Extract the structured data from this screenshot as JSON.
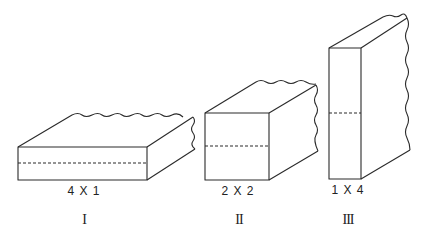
{
  "figure": {
    "shapes": [
      {
        "id": "I",
        "dimension_label": "4 X 1",
        "numeral": "I",
        "description": "wide flat block, split horizontally by dashed line"
      },
      {
        "id": "II",
        "dimension_label": "2 X 2",
        "numeral": "II",
        "description": "square cross-section block, split horizontally by dashed line"
      },
      {
        "id": "III",
        "dimension_label": "1 X 4",
        "numeral": "III",
        "description": "tall narrow block, split horizontally by dashed line"
      }
    ],
    "colors": {
      "line": "#2a2a2a",
      "background": "#ffffff"
    }
  }
}
